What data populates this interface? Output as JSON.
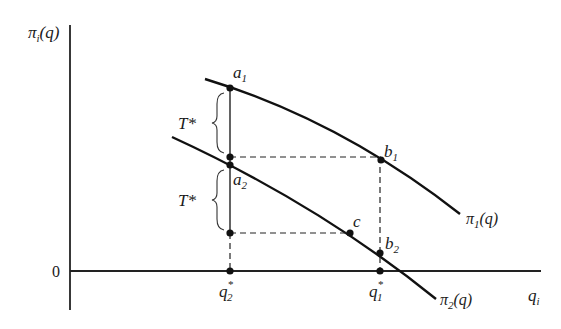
{
  "diagram": {
    "y_axis_label": "π",
    "y_axis_label_sub": "i",
    "y_axis_label_arg": "(q)",
    "x_axis_label": "q",
    "x_axis_label_sub": "i",
    "origin_label": "0",
    "curves": [
      {
        "name": "π",
        "sub": "1",
        "arg": "(q)"
      },
      {
        "name": "π",
        "sub": "2",
        "arg": "(q)"
      }
    ],
    "points": {
      "a1": {
        "base": "a",
        "sub": "1"
      },
      "a2": {
        "base": "a",
        "sub": "2"
      },
      "b1": {
        "base": "b",
        "sub": "1"
      },
      "b2": {
        "base": "b",
        "sub": "2"
      },
      "c": {
        "base": "c"
      }
    },
    "x_ticks": [
      {
        "base": "q",
        "sub": "2",
        "sup": "*"
      },
      {
        "base": "q",
        "sub": "1",
        "sup": "*"
      }
    ],
    "braces": [
      {
        "label": "T*"
      },
      {
        "label": "T*"
      }
    ]
  }
}
